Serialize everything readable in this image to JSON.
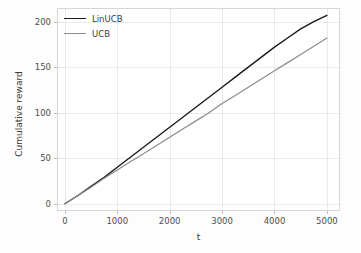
{
  "chart_data": {
    "type": "line",
    "title": "",
    "xlabel": "t",
    "ylabel": "Cumulative reward",
    "xlim": [
      -150,
      5250
    ],
    "ylim": [
      -8,
      215
    ],
    "grid": true,
    "legend_position": "upper left",
    "xticks": [
      0,
      1000,
      2000,
      3000,
      4000,
      5000
    ],
    "xtick_labels": [
      "0",
      "1000",
      "2000",
      "3000",
      "4000",
      "5000"
    ],
    "yticks": [
      0,
      50,
      100,
      150,
      200
    ],
    "ytick_labels": [
      "0",
      "50",
      "100",
      "150",
      "200"
    ],
    "x": [
      0,
      250,
      500,
      750,
      1000,
      1250,
      1500,
      1750,
      2000,
      2250,
      2500,
      2750,
      3000,
      3250,
      3500,
      3750,
      4000,
      4250,
      4500,
      4750,
      5000
    ],
    "series": [
      {
        "name": "LinUCB",
        "color": "#1a1a1a",
        "linewidth": 1.4,
        "values": [
          0,
          9,
          19,
          29,
          40,
          51,
          62,
          73,
          84,
          95,
          106,
          117,
          128,
          139,
          150,
          161,
          172,
          182,
          192,
          200,
          207
        ]
      },
      {
        "name": "UCB",
        "color": "#8c8c8c",
        "linewidth": 1.2,
        "values": [
          0,
          9,
          18,
          28,
          37,
          46,
          55,
          64,
          73,
          82,
          91,
          100,
          110,
          119,
          128,
          137,
          146,
          155,
          164,
          173,
          182
        ]
      }
    ]
  },
  "legend": {
    "entries": [
      {
        "label": "LinUCB"
      },
      {
        "label": "UCB"
      }
    ]
  },
  "colors": {
    "linucb": "#1a1a1a",
    "ucb": "#8c8c8c",
    "grid": "#e9e9e9",
    "spine": "#d6d6d6",
    "text": "#4d4d4d",
    "figure_background": "#fdfdfd",
    "axes_background": "#ffffff"
  }
}
